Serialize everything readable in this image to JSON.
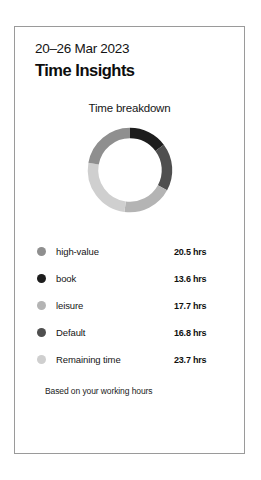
{
  "card": {
    "date_range": "20–26 Mar 2023",
    "title": "Time Insights",
    "footnote": "Based on your working hours"
  },
  "chart_data": {
    "type": "pie",
    "variant": "donut",
    "title": "Time breakdown",
    "unit": "hrs",
    "total": 92.3,
    "start_angle_deg": 0,
    "direction": "clockwise",
    "legend_position": "bottom",
    "grid": false,
    "categories": [
      "high-value",
      "book",
      "leisure",
      "Default",
      "Remaining time"
    ],
    "values": [
      20.5,
      13.6,
      17.7,
      16.8,
      23.7
    ],
    "value_labels": [
      "20.5 hrs",
      "13.6 hrs",
      "17.7 hrs",
      "16.8 hrs",
      "23.7 hrs"
    ],
    "colors": [
      "#8f8f8f",
      "#1d1d1d",
      "#b4b4b4",
      "#4f4f4f",
      "#cfcfcf"
    ],
    "segments": [
      {
        "name": "book",
        "value": 13.6,
        "color": "#1d1d1d",
        "start_deg": 0,
        "end_deg": 53.1
      },
      {
        "name": "Default",
        "value": 16.8,
        "color": "#4f4f4f",
        "start_deg": 53.1,
        "end_deg": 118.6
      },
      {
        "name": "leisure",
        "value": 17.7,
        "color": "#b4b4b4",
        "start_deg": 118.6,
        "end_deg": 187.6
      },
      {
        "name": "Remaining time",
        "value": 23.7,
        "color": "#cfcfcf",
        "start_deg": 187.6,
        "end_deg": 280.0
      },
      {
        "name": "high-value",
        "value": 20.5,
        "color": "#8f8f8f",
        "start_deg": 280.0,
        "end_deg": 360.0
      }
    ]
  },
  "legend": [
    {
      "label": "high-value",
      "value": "20.5 hrs",
      "color": "#8f8f8f"
    },
    {
      "label": "book",
      "value": "13.6 hrs",
      "color": "#1d1d1d"
    },
    {
      "label": "leisure",
      "value": "17.7 hrs",
      "color": "#b4b4b4"
    },
    {
      "label": "Default",
      "value": "16.8 hrs",
      "color": "#4f4f4f"
    },
    {
      "label": "Remaining time",
      "value": "23.7 hrs",
      "color": "#cfcfcf"
    }
  ]
}
